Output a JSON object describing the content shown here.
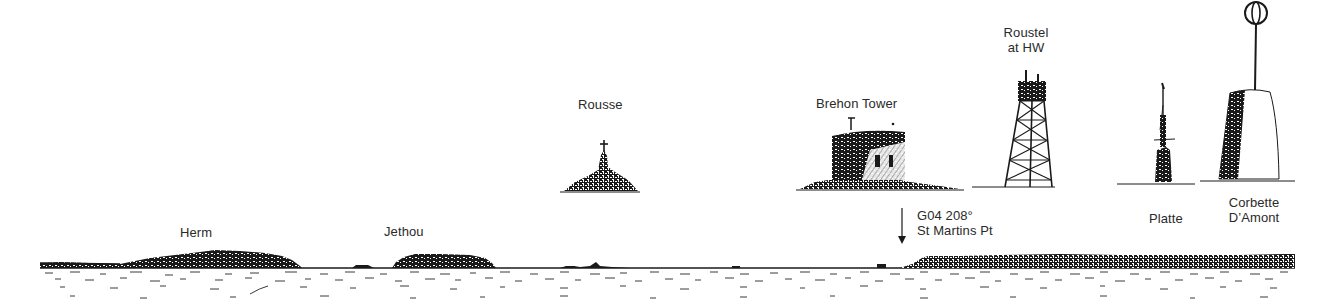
{
  "diagram": {
    "type": "coastal-view-sketch",
    "ink_color": "#1a1a1a",
    "background": "#ffffff"
  },
  "labels": {
    "herm": "Herm",
    "jethou": "Jethou",
    "rousse": "Rousse",
    "brehon": "Brehon Tower",
    "roustel_line1": "Roustel",
    "roustel_line2": "at HW",
    "bearing_line1": "G04 208°",
    "bearing_line2": "St Martins Pt",
    "platte": "Platte",
    "corbette_line1": "Corbette",
    "corbette_line2": "D’Amont"
  },
  "landmarks": [
    {
      "name": "Herm",
      "kind": "island",
      "position": "horizon-left"
    },
    {
      "name": "Jethou",
      "kind": "island",
      "position": "horizon"
    },
    {
      "name": "Rousse",
      "kind": "rock-with-beacon",
      "position": "inset"
    },
    {
      "name": "Brehon Tower",
      "kind": "round-fort",
      "position": "inset"
    },
    {
      "name": "Roustel at HW",
      "kind": "lattice-beacon-tower",
      "position": "inset"
    },
    {
      "name": "Platte",
      "kind": "stone-beacon",
      "position": "inset"
    },
    {
      "name": "Corbette D’Amont",
      "kind": "beacon-with-ball-topmark",
      "position": "inset"
    },
    {
      "name": "St Martins Pt",
      "kind": "headland",
      "bearing": "208°",
      "waypoint": "G04",
      "position": "horizon-right"
    }
  ]
}
